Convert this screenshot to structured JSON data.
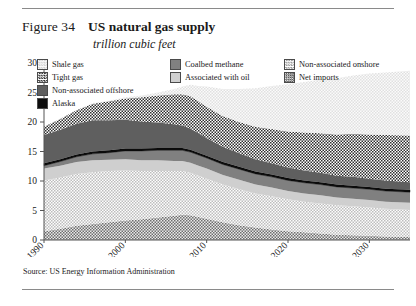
{
  "figure": {
    "label": "Figure 34",
    "title": "US natural gas supply",
    "subtitle": "trillion cubic feet",
    "source": "Source: US Energy Information Administration"
  },
  "colors": {
    "shale_gas": "#ececec",
    "tight_gas": "#d9d9d9",
    "non_associated_offshore": "#5f5f5f",
    "alaska": "#0d0d0d",
    "coalbed_methane": "#808080",
    "associated_with_oil": "#cfcfcf",
    "non_associated_onshore": "#e3e3e3",
    "net_imports": "#b4b4b4",
    "axis": "#555555",
    "rule": "#8a8a8a"
  },
  "legend": {
    "columns": [
      [
        {
          "label": "Shale gas",
          "key": "shale_gas",
          "pattern": "light-dots"
        },
        {
          "label": "Tight gas",
          "key": "tight_gas",
          "pattern": "checker-fine"
        },
        {
          "label": "Non-associated offshore",
          "key": "non_associated_offshore",
          "pattern": "solid-dark-gray"
        },
        {
          "label": "Alaska",
          "key": "alaska",
          "pattern": "solid-black"
        }
      ],
      [
        {
          "label": "Coalbed methane",
          "key": "coalbed_methane",
          "pattern": "solid-mid-gray"
        },
        {
          "label": "Associated with oil",
          "key": "associated_with_oil",
          "pattern": "solid-light-gray"
        }
      ],
      [
        {
          "label": "Non-associated onshore",
          "key": "non_associated_onshore",
          "pattern": "checker-light"
        },
        {
          "label": "Net imports",
          "key": "net_imports",
          "pattern": "checker-dense"
        }
      ]
    ]
  },
  "chart_data": {
    "type": "area",
    "stacked": true,
    "title": "US natural gas supply",
    "subtitle": "trillion cubic feet",
    "xlabel": "",
    "ylabel": "",
    "ylim": [
      0,
      30
    ],
    "yticks": [
      0,
      5,
      10,
      15,
      20,
      25,
      30
    ],
    "xlim": [
      1990,
      2035
    ],
    "xticks": [
      1990,
      2000,
      2010,
      2020,
      2030
    ],
    "xtick_labels": [
      "1990",
      "2000",
      "2010",
      "2020",
      "2030"
    ],
    "xtick_rotation": 45,
    "grid": false,
    "legend_position": "top",
    "x": [
      1990,
      1992,
      1994,
      1996,
      1998,
      2000,
      2002,
      2004,
      2006,
      2007,
      2008,
      2009,
      2010,
      2012,
      2014,
      2016,
      2018,
      2020,
      2022,
      2024,
      2026,
      2028,
      2030,
      2032,
      2035
    ],
    "stack_order_bottom_to_top": [
      "net_imports",
      "non_associated_onshore",
      "associated_with_oil",
      "coalbed_methane",
      "alaska",
      "non_associated_offshore",
      "tight_gas",
      "shale_gas"
    ],
    "series": [
      {
        "name": "Net imports",
        "key": "net_imports",
        "values": [
          1.5,
          1.9,
          2.4,
          2.7,
          3.0,
          3.3,
          3.5,
          3.8,
          4.1,
          4.3,
          4.2,
          3.9,
          3.6,
          3.0,
          2.5,
          2.1,
          1.8,
          1.5,
          1.3,
          1.1,
          0.9,
          0.8,
          0.7,
          0.6,
          0.5
        ]
      },
      {
        "name": "Non-associated onshore",
        "key": "non_associated_onshore",
        "values": [
          8.6,
          8.7,
          8.8,
          8.8,
          8.7,
          8.5,
          8.2,
          7.9,
          7.6,
          7.4,
          7.2,
          7.0,
          6.8,
          6.4,
          6.1,
          5.8,
          5.6,
          5.4,
          5.2,
          5.1,
          5.0,
          4.9,
          4.8,
          4.7,
          4.6
        ]
      },
      {
        "name": "Associated with oil",
        "key": "associated_with_oil",
        "values": [
          2.0,
          2.0,
          2.0,
          2.0,
          1.9,
          1.9,
          1.8,
          1.8,
          1.7,
          1.7,
          1.7,
          1.7,
          1.7,
          1.6,
          1.6,
          1.5,
          1.5,
          1.4,
          1.4,
          1.4,
          1.3,
          1.3,
          1.3,
          1.2,
          1.2
        ]
      },
      {
        "name": "Coalbed methane",
        "key": "coalbed_methane",
        "values": [
          0.5,
          0.7,
          0.9,
          1.1,
          1.2,
          1.4,
          1.6,
          1.7,
          1.8,
          1.8,
          1.8,
          1.8,
          1.8,
          1.8,
          1.8,
          1.8,
          1.8,
          1.8,
          1.8,
          1.8,
          1.8,
          1.8,
          1.8,
          1.8,
          1.8
        ]
      },
      {
        "name": "Alaska",
        "key": "alaska",
        "values": [
          0.4,
          0.4,
          0.4,
          0.4,
          0.4,
          0.4,
          0.4,
          0.4,
          0.4,
          0.4,
          0.4,
          0.4,
          0.4,
          0.4,
          0.4,
          0.4,
          0.4,
          0.4,
          0.4,
          0.4,
          0.4,
          0.4,
          0.4,
          0.4,
          0.4
        ]
      },
      {
        "name": "Non-associated offshore",
        "key": "non_associated_offshore",
        "values": [
          4.8,
          5.0,
          5.2,
          5.3,
          5.1,
          4.9,
          4.6,
          4.3,
          4.0,
          3.8,
          3.6,
          3.3,
          3.0,
          2.6,
          2.3,
          2.1,
          1.9,
          1.8,
          1.7,
          1.6,
          1.5,
          1.5,
          1.4,
          1.4,
          1.3
        ]
      },
      {
        "name": "Tight gas",
        "key": "tight_gas",
        "values": [
          1.4,
          1.8,
          2.3,
          2.8,
          3.2,
          3.6,
          4.1,
          4.6,
          5.1,
          5.3,
          5.5,
          5.4,
          5.3,
          5.2,
          5.3,
          5.5,
          5.8,
          6.1,
          6.4,
          6.7,
          7.0,
          7.3,
          7.5,
          7.7,
          7.9
        ]
      },
      {
        "name": "Shale gas",
        "key": "shale_gas",
        "values": [
          0.0,
          0.0,
          0.0,
          0.1,
          0.1,
          0.2,
          0.3,
          0.5,
          0.9,
          1.3,
          1.9,
          2.6,
          3.4,
          4.6,
          5.6,
          6.5,
          7.3,
          8.0,
          8.6,
          9.1,
          9.5,
          9.9,
          10.3,
          10.6,
          11.0
        ]
      }
    ],
    "totals": [
      19.2,
      20.5,
      22.0,
      23.2,
      23.6,
      24.2,
      24.5,
      25.0,
      25.6,
      26.0,
      26.3,
      26.1,
      26.0,
      25.6,
      25.6,
      25.8,
      26.1,
      26.4,
      26.8,
      27.2,
      27.4,
      27.8,
      28.2,
      28.4,
      28.7
    ]
  }
}
